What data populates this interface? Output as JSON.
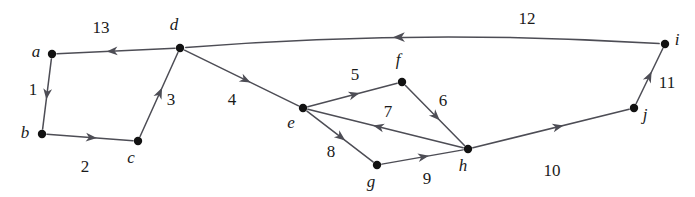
{
  "figure": {
    "type": "directed-weighted-graph",
    "background_color": "#ffffff",
    "edge_color": "#4d4d55",
    "node_color": "#121212",
    "label_color": "#1a1a1a",
    "width": 695,
    "height": 197
  },
  "nodes": [
    {
      "id": "a",
      "label": "a",
      "x": 52,
      "y": 54,
      "label_x": 36,
      "label_y": 57
    },
    {
      "id": "b",
      "label": "b",
      "x": 42,
      "y": 134,
      "label_x": 25,
      "label_y": 138
    },
    {
      "id": "c",
      "label": "c",
      "x": 138,
      "y": 141,
      "label_x": 131,
      "label_y": 163
    },
    {
      "id": "d",
      "label": "d",
      "x": 180,
      "y": 48,
      "label_x": 174,
      "label_y": 30
    },
    {
      "id": "e",
      "label": "e",
      "x": 303,
      "y": 108,
      "label_x": 291,
      "label_y": 128
    },
    {
      "id": "f",
      "label": "f",
      "x": 402,
      "y": 82,
      "label_x": 398,
      "label_y": 65
    },
    {
      "id": "g",
      "label": "g",
      "x": 377,
      "y": 165,
      "label_x": 371,
      "label_y": 187
    },
    {
      "id": "h",
      "label": "h",
      "x": 468,
      "y": 149,
      "label_x": 463,
      "label_y": 171
    },
    {
      "id": "i",
      "label": "i",
      "x": 665,
      "y": 44,
      "label_x": 677,
      "label_y": 45
    },
    {
      "id": "j",
      "label": "j",
      "x": 634,
      "y": 108,
      "label_x": 645,
      "label_y": 120
    }
  ],
  "edges": [
    {
      "id": "e1",
      "from": "a",
      "to": "b",
      "weight": "1",
      "label_x": 33,
      "label_y": 95,
      "curved": false
    },
    {
      "id": "e2",
      "from": "b",
      "to": "c",
      "weight": "2",
      "label_x": 85,
      "label_y": 172,
      "curved": false
    },
    {
      "id": "e3",
      "from": "c",
      "to": "d",
      "weight": "3",
      "label_x": 171,
      "label_y": 105,
      "curved": false
    },
    {
      "id": "e4",
      "from": "d",
      "to": "e",
      "weight": "4",
      "label_x": 232,
      "label_y": 105,
      "curved": false
    },
    {
      "id": "e5",
      "from": "e",
      "to": "f",
      "weight": "5",
      "label_x": 355,
      "label_y": 80,
      "curved": false
    },
    {
      "id": "e6",
      "from": "f",
      "to": "h",
      "weight": "6",
      "label_x": 443,
      "label_y": 106,
      "curved": false
    },
    {
      "id": "e7",
      "from": "h",
      "to": "e",
      "weight": "7",
      "label_x": 388,
      "label_y": 117,
      "curved": false
    },
    {
      "id": "e8",
      "from": "e",
      "to": "g",
      "weight": "8",
      "label_x": 331,
      "label_y": 157,
      "curved": false
    },
    {
      "id": "e9",
      "from": "g",
      "to": "h",
      "weight": "9",
      "label_x": 427,
      "label_y": 184,
      "curved": false
    },
    {
      "id": "e10",
      "from": "h",
      "to": "j",
      "weight": "10",
      "label_x": 552,
      "label_y": 176,
      "curved": false
    },
    {
      "id": "e11",
      "from": "j",
      "to": "i",
      "weight": "11",
      "label_x": 667,
      "label_y": 88,
      "curved": false
    },
    {
      "id": "e12",
      "from": "i",
      "to": "d",
      "weight": "12",
      "label_x": 527,
      "label_y": 24,
      "curved": true,
      "curve_cx": 420,
      "curve_cy": 28
    },
    {
      "id": "e13",
      "from": "d",
      "to": "a",
      "weight": "13",
      "label_x": 101,
      "label_y": 33,
      "curved": false
    }
  ],
  "chart_data": {
    "type": "diagram",
    "title": "",
    "nodes": [
      "a",
      "b",
      "c",
      "d",
      "e",
      "f",
      "g",
      "h",
      "i",
      "j"
    ],
    "directed": true,
    "weighted": true,
    "edge_list": [
      {
        "from": "a",
        "to": "b",
        "weight": 1
      },
      {
        "from": "b",
        "to": "c",
        "weight": 2
      },
      {
        "from": "c",
        "to": "d",
        "weight": 3
      },
      {
        "from": "d",
        "to": "e",
        "weight": 4
      },
      {
        "from": "e",
        "to": "f",
        "weight": 5
      },
      {
        "from": "f",
        "to": "h",
        "weight": 6
      },
      {
        "from": "h",
        "to": "e",
        "weight": 7
      },
      {
        "from": "e",
        "to": "g",
        "weight": 8
      },
      {
        "from": "g",
        "to": "h",
        "weight": 9
      },
      {
        "from": "h",
        "to": "j",
        "weight": 10
      },
      {
        "from": "j",
        "to": "i",
        "weight": 11
      },
      {
        "from": "i",
        "to": "d",
        "weight": 12
      },
      {
        "from": "d",
        "to": "a",
        "weight": 13
      }
    ]
  }
}
